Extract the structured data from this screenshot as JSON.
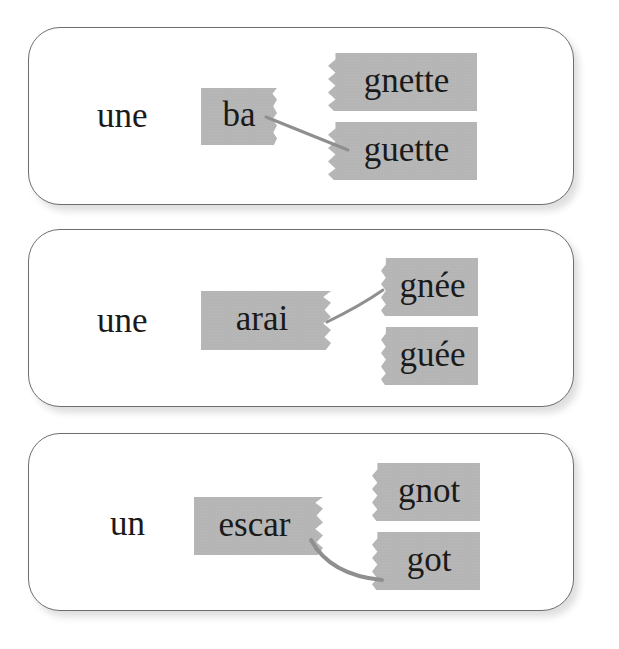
{
  "exercise": {
    "cards": [
      {
        "article": "une",
        "stem": "ba",
        "endings": [
          "gnette",
          "guette"
        ],
        "linked_ending_index": 1
      },
      {
        "article": "une",
        "stem": "arai",
        "endings": [
          "gnée",
          "guée"
        ],
        "linked_ending_index": 0
      },
      {
        "article": "un",
        "stem": "escar",
        "endings": [
          "gnot",
          "got"
        ],
        "linked_ending_index": 1
      }
    ],
    "colors": {
      "tile": "#b5b5b5",
      "link_line": "#8f8f8f",
      "card_border": "#6e6e6e"
    }
  }
}
